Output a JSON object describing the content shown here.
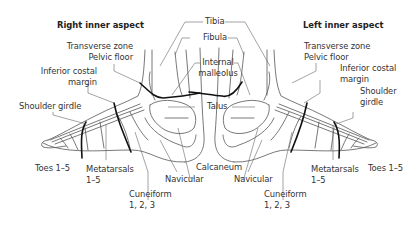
{
  "diagram": {
    "type": "anatomical-reflexology-map",
    "feet": [
      {
        "id": "right",
        "title": "Right inner aspect",
        "labels": {
          "transverse_zone": "Transverse zone",
          "pelvic_floor": "Pelvic floor",
          "inferior_costal_1": "Inferior costal",
          "inferior_costal_2": "margin",
          "shoulder_girdle": "Shoulder girdle",
          "toes": "Toes 1–5",
          "metatarsals_1": "Metatarsals",
          "metatarsals_2": "1–5",
          "navicular": "Navicular",
          "cuneiform_1": "Cuneiform",
          "cuneiform_2": "1, 2, 3"
        }
      },
      {
        "id": "left",
        "title": "Left inner aspect",
        "labels": {
          "transverse_zone": "Transverse zone",
          "pelvic_floor": "Pelvic floor",
          "inferior_costal_1": "Inferior costal",
          "inferior_costal_2": "margin",
          "shoulder_1": "Shoulder",
          "shoulder_2": "girdle",
          "toes": "Toes 1–5",
          "metatarsals_1": "Metatarsals",
          "metatarsals_2": "1–5",
          "navicular": "Navicular",
          "cuneiform_1": "Cuneiform",
          "cuneiform_2": "1, 2, 3"
        }
      }
    ],
    "shared_labels": {
      "tibia": "Tibia",
      "fibula": "Fibula",
      "internal_malleolus_1": "Internal",
      "internal_malleolus_2": "malleolus",
      "talus": "Talus",
      "calcaneum": "Calcaneum"
    },
    "colors": {
      "outline": "#555555",
      "zone_line": "#111111",
      "leader": "#666666",
      "text": "#333333"
    }
  }
}
